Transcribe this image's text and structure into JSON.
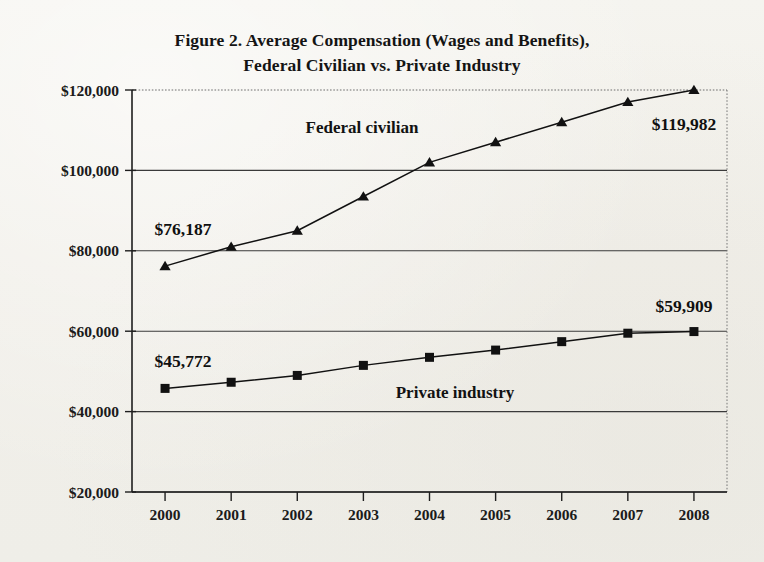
{
  "title": {
    "line1": "Figure 2. Average Compensation (Wages and Benefits),",
    "line2": "Federal Civilian vs. Private Industry"
  },
  "annotations": {
    "federal_first": "$76,187",
    "federal_last": "$119,982",
    "private_first": "$45,772",
    "private_last": "$59,909",
    "federal_series_label": "Federal civilian",
    "private_series_label": "Private industry"
  },
  "axis": {
    "y_ticks": [
      "$120,000",
      "$100,000",
      "$80,000",
      "$60,000",
      "$40,000",
      "$20,000"
    ],
    "x_ticks": [
      "2000",
      "2001",
      "2002",
      "2003",
      "2004",
      "2005",
      "2006",
      "2007",
      "2008"
    ]
  },
  "colors": {
    "ink": "#111111",
    "grid": "#3a3a3a",
    "paper": "#f2f1ec"
  },
  "chart_data": {
    "type": "line",
    "title": "Figure 2. Average Compensation (Wages and Benefits), Federal Civilian vs. Private Industry",
    "xlabel": "",
    "ylabel": "",
    "x": [
      2000,
      2001,
      2002,
      2003,
      2004,
      2005,
      2006,
      2007,
      2008
    ],
    "categories": [
      "2000",
      "2001",
      "2002",
      "2003",
      "2004",
      "2005",
      "2006",
      "2007",
      "2008"
    ],
    "ylim": [
      20000,
      120000
    ],
    "ytick_values": [
      20000,
      40000,
      60000,
      80000,
      100000,
      120000
    ],
    "ytick_labels": [
      "$20,000",
      "$40,000",
      "$60,000",
      "$80,000",
      "$100,000",
      "$120,000"
    ],
    "grid": true,
    "legend": "inline-series-labels",
    "series": [
      {
        "name": "Federal civilian",
        "marker": "triangle",
        "values": [
          76187,
          81000,
          85000,
          93500,
          102000,
          107000,
          112000,
          117000,
          119982
        ],
        "labeled_points": [
          {
            "x": 2000,
            "value": 76187,
            "text": "$76,187"
          },
          {
            "x": 2008,
            "value": 119982,
            "text": "$119,982"
          }
        ]
      },
      {
        "name": "Private industry",
        "marker": "square",
        "values": [
          45772,
          47300,
          49000,
          51500,
          53500,
          55300,
          57400,
          59500,
          59909
        ],
        "labeled_points": [
          {
            "x": 2000,
            "value": 45772,
            "text": "$45,772"
          },
          {
            "x": 2008,
            "value": 59909,
            "text": "$59,909"
          }
        ]
      }
    ]
  }
}
